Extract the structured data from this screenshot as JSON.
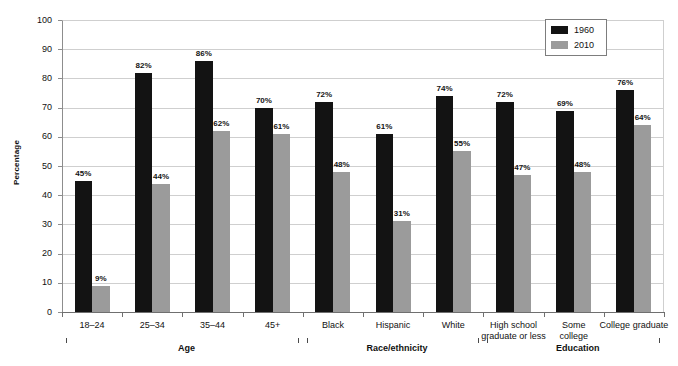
{
  "chart_data": {
    "type": "bar",
    "title": "",
    "xlabel": "",
    "ylabel": "Percentage",
    "ylim": [
      0,
      100
    ],
    "ytick_step": 10,
    "yticks": [
      100,
      90,
      80,
      70,
      60,
      50,
      40,
      30,
      20,
      10,
      0
    ],
    "grid": true,
    "legend_position": "top-right",
    "categories": [
      "18–24",
      "25–34",
      "35–44",
      "45+",
      "Black",
      "Hispanic",
      "White",
      "High school\ngraduate or less",
      "Some\ncollege",
      "College graduate"
    ],
    "series": [
      {
        "name": "1960",
        "color": "#131313",
        "values": [
          45,
          82,
          86,
          70,
          72,
          61,
          74,
          72,
          69,
          76
        ],
        "labels": [
          "45%",
          "82%",
          "86%",
          "70%",
          "72%",
          "61%",
          "74%",
          "72%",
          "69%",
          "76%"
        ]
      },
      {
        "name": "2010",
        "color": "#9b9b9b",
        "values": [
          9,
          44,
          62,
          61,
          48,
          31,
          55,
          47,
          48,
          64
        ],
        "labels": [
          "9%",
          "44%",
          "62%",
          "61%",
          "48%",
          "31%",
          "55%",
          "47%",
          "48%",
          "64%"
        ]
      }
    ],
    "groups": [
      {
        "label": "Age",
        "start_index": 0,
        "end_index": 3
      },
      {
        "label": "Race/ethnicity",
        "start_index": 4,
        "end_index": 6
      },
      {
        "label": "Education",
        "start_index": 7,
        "end_index": 9
      }
    ]
  },
  "legend": {
    "entries": [
      {
        "label": "1960",
        "color": "#131313"
      },
      {
        "label": "2010",
        "color": "#9b9b9b"
      }
    ]
  }
}
